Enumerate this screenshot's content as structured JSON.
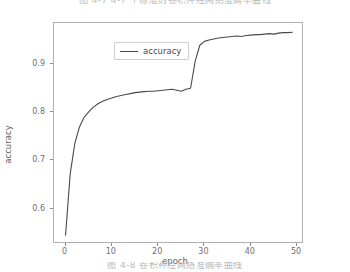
{
  "caption_top": "图 4-7     4-7 个标准的卷积神经网络准确率曲线",
  "caption_bottom": "图 4-8   卷积神经网络准确率曲线",
  "chart_data": {
    "type": "line",
    "title": "",
    "xlabel": "epoch",
    "ylabel": "accuracy",
    "xlim": [
      -2.5,
      51.5
    ],
    "ylim": [
      0.527,
      0.984
    ],
    "xticks": [
      0,
      10,
      20,
      30,
      40,
      50
    ],
    "xticklabels": [
      "0",
      "10",
      "20",
      "30",
      "40",
      "50"
    ],
    "yticks": [
      0.6,
      0.7,
      0.8,
      0.9
    ],
    "yticklabels": [
      "0.6",
      "0.7",
      "0.8",
      "0.9"
    ],
    "grid": false,
    "legend": {
      "position": "upper left",
      "entries": [
        "accuracy"
      ]
    },
    "line_color": "#4a4a4a",
    "series": [
      {
        "name": "accuracy",
        "x": [
          0,
          1,
          2,
          3,
          4,
          5,
          6,
          7,
          8,
          9,
          10,
          11,
          12,
          13,
          14,
          15,
          16,
          17,
          18,
          19,
          20,
          21,
          22,
          23,
          24,
          25,
          26,
          27,
          28,
          29,
          30,
          31,
          32,
          33,
          34,
          35,
          36,
          37,
          38,
          39,
          40,
          41,
          42,
          43,
          44,
          45,
          46,
          47,
          48,
          49
        ],
        "values": [
          0.545,
          0.672,
          0.735,
          0.769,
          0.789,
          0.8,
          0.81,
          0.817,
          0.822,
          0.826,
          0.829,
          0.832,
          0.834,
          0.836,
          0.838,
          0.84,
          0.841,
          0.842,
          0.843,
          0.843,
          0.844,
          0.845,
          0.846,
          0.847,
          0.845,
          0.843,
          0.847,
          0.849,
          0.905,
          0.938,
          0.946,
          0.949,
          0.951,
          0.953,
          0.954,
          0.955,
          0.956,
          0.957,
          0.956,
          0.958,
          0.959,
          0.96,
          0.96,
          0.961,
          0.962,
          0.961,
          0.963,
          0.964,
          0.964,
          0.965
        ]
      }
    ]
  }
}
